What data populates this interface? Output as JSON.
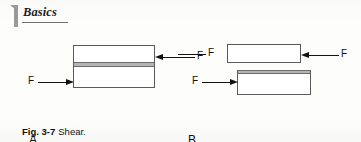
{
  "header": {
    "chapter_number": "1",
    "title": "Basics"
  },
  "figure": {
    "panels": [
      {
        "id": "A",
        "letter": "A",
        "description": "Single block with internal shear plane",
        "force_labels": [
          "F",
          "F"
        ]
      },
      {
        "id": "B",
        "letter": "B",
        "description": "Two offset blocks displaced by shear",
        "force_labels": [
          "F",
          "F",
          "F"
        ]
      }
    ],
    "force_symbol": "F",
    "panel_a": {
      "arrow_left_label": "F",
      "arrow_right_label": "F",
      "letter": "A"
    },
    "panel_b": {
      "arrow_far_left_label": "F",
      "arrow_right_label": "F",
      "arrow_left_label": "F",
      "letter": "B"
    }
  },
  "caption": {
    "number": "Fig. 3-7",
    "text": "Shear."
  },
  "colors": {
    "line": "#5a5a5a",
    "arrow": "#121212",
    "shear_band": "#b4b4b4",
    "chapter_mark": "#9a9a9a",
    "page_background": "#fdfdfc"
  }
}
